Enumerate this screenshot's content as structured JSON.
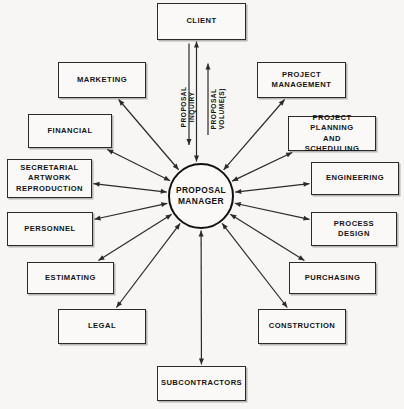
{
  "diagram": {
    "hub": {
      "name": "proposal-manager",
      "label": "PROPOSAL\nMANAGER",
      "shape": "circle",
      "cx": 201,
      "cy": 196,
      "r": 33
    },
    "colors": {
      "background": "#f7f6f4",
      "box_fill": "#faf9f7",
      "stroke": "#2b2b2b",
      "text": "#141414"
    },
    "flow_labels": [
      {
        "name": "proposal-inquiry",
        "text": "PROPOSAL INQUIRY",
        "direction": "down",
        "from": "client",
        "to": "proposal-manager"
      },
      {
        "name": "proposal-volumes",
        "text": "PROPOSAL\nVOLUME(S)",
        "direction": "up",
        "from": "proposal-manager",
        "to": "client"
      }
    ],
    "nodes": [
      {
        "name": "client",
        "label": "CLIENT",
        "x": 157,
        "y": 3,
        "w": 89,
        "h": 37
      },
      {
        "name": "marketing",
        "label": "MARKETING",
        "x": 58,
        "y": 62,
        "w": 88,
        "h": 36
      },
      {
        "name": "financial",
        "label": "FINANCIAL",
        "x": 28,
        "y": 114,
        "w": 84,
        "h": 34
      },
      {
        "name": "secretarial",
        "label": "SECRETARIAL\nARTWORK\nREPRODUCTION",
        "x": 7,
        "y": 159,
        "w": 85,
        "h": 39
      },
      {
        "name": "personnel",
        "label": "PERSONNEL",
        "x": 7,
        "y": 212,
        "w": 86,
        "h": 34
      },
      {
        "name": "estimating",
        "label": "ESTIMATING",
        "x": 27,
        "y": 262,
        "w": 87,
        "h": 32
      },
      {
        "name": "legal",
        "label": "LEGAL",
        "x": 58,
        "y": 309,
        "w": 88,
        "h": 35
      },
      {
        "name": "subcontractors",
        "label": "SUBCONTRACTORS",
        "x": 157,
        "y": 366,
        "w": 89,
        "h": 35
      },
      {
        "name": "construction",
        "label": "CONSTRUCTION",
        "x": 258,
        "y": 309,
        "w": 88,
        "h": 35
      },
      {
        "name": "purchasing",
        "label": "PURCHASING",
        "x": 289,
        "y": 262,
        "w": 87,
        "h": 32
      },
      {
        "name": "process-design",
        "label": "PROCESS\nDESIGN",
        "x": 311,
        "y": 212,
        "w": 86,
        "h": 34
      },
      {
        "name": "engineering",
        "label": "ENGINEERING",
        "x": 311,
        "y": 162,
        "w": 88,
        "h": 33
      },
      {
        "name": "project-planning",
        "label": "PROJECT PLANNING\nAND\nSCHEDULING",
        "x": 288,
        "y": 116,
        "w": 88,
        "h": 35
      },
      {
        "name": "project-management",
        "label": "PROJECT\nMANAGEMENT",
        "x": 257,
        "y": 62,
        "w": 89,
        "h": 36
      }
    ],
    "edges": [
      {
        "name": "edge-marketing",
        "from": "proposal-manager",
        "to": "marketing",
        "arrows": "both"
      },
      {
        "name": "edge-financial",
        "from": "proposal-manager",
        "to": "financial",
        "arrows": "both"
      },
      {
        "name": "edge-secretarial",
        "from": "proposal-manager",
        "to": "secretarial",
        "arrows": "both"
      },
      {
        "name": "edge-personnel",
        "from": "proposal-manager",
        "to": "personnel",
        "arrows": "both"
      },
      {
        "name": "edge-estimating",
        "from": "proposal-manager",
        "to": "estimating",
        "arrows": "both"
      },
      {
        "name": "edge-legal",
        "from": "proposal-manager",
        "to": "legal",
        "arrows": "both"
      },
      {
        "name": "edge-subcontractors",
        "from": "proposal-manager",
        "to": "subcontractors",
        "arrows": "both"
      },
      {
        "name": "edge-construction",
        "from": "proposal-manager",
        "to": "construction",
        "arrows": "both"
      },
      {
        "name": "edge-purchasing",
        "from": "proposal-manager",
        "to": "purchasing",
        "arrows": "both"
      },
      {
        "name": "edge-process-design",
        "from": "proposal-manager",
        "to": "process-design",
        "arrows": "both"
      },
      {
        "name": "edge-engineering",
        "from": "proposal-manager",
        "to": "engineering",
        "arrows": "both"
      },
      {
        "name": "edge-project-planning",
        "from": "proposal-manager",
        "to": "project-planning",
        "arrows": "both"
      },
      {
        "name": "edge-project-management",
        "from": "proposal-manager",
        "to": "project-management",
        "arrows": "both"
      },
      {
        "name": "edge-client",
        "from": "proposal-manager",
        "to": "client",
        "arrows": "both"
      }
    ]
  }
}
